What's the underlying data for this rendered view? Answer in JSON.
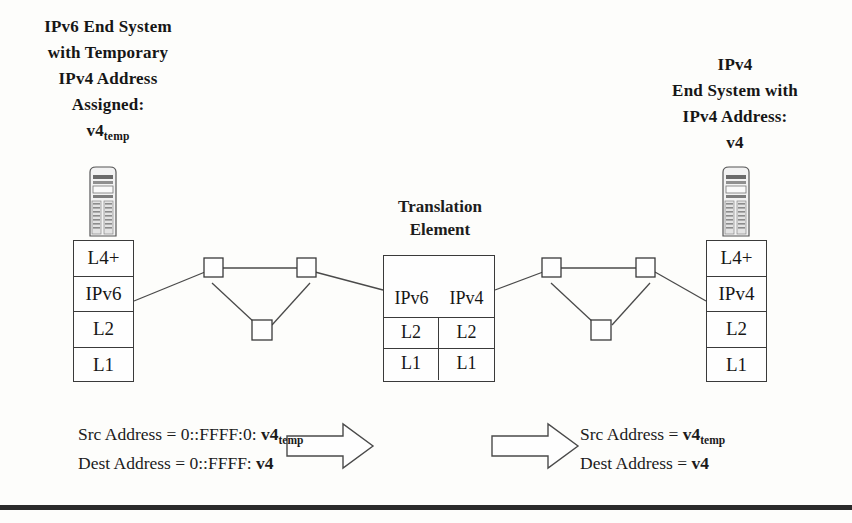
{
  "diagram": {
    "left_end_system": {
      "caption_lines": [
        "IPv6 End System",
        "with Temporary",
        "IPv4 Address",
        "Assigned:"
      ],
      "address_label": "v4",
      "address_subscript": "temp",
      "icon": "server-tower-icon",
      "stack": [
        "L4+",
        "IPv6",
        "L2",
        "L1"
      ]
    },
    "right_end_system": {
      "caption_lines": [
        "IPv4",
        "End System with",
        "IPv4 Address:",
        "v4"
      ],
      "icon": "server-tower-icon",
      "stack": [
        "L4+",
        "IPv4",
        "L2",
        "L1"
      ]
    },
    "translation_element": {
      "caption_lines": [
        "Translation",
        "Element"
      ],
      "top_left": "IPv6",
      "top_right": "IPv4",
      "rows": [
        {
          "left": "L2",
          "right": "L2"
        },
        {
          "left": "L1",
          "right": "L1"
        }
      ]
    },
    "left_network": {
      "name": "IPv6 network cloud",
      "routers": [
        "router-1",
        "router-2",
        "router-3"
      ]
    },
    "right_network": {
      "name": "IPv4 network cloud",
      "routers": [
        "router-4",
        "router-5",
        "router-6"
      ]
    },
    "left_addresses": {
      "src_prefix": "Src Address = 0::FFFF:0: ",
      "src_value": "v4",
      "src_value_sub": "temp",
      "dest_prefix": "Dest Address = 0::FFFF: ",
      "dest_value": "v4"
    },
    "right_addresses": {
      "src_prefix": "Src Address = ",
      "src_value": "v4",
      "src_value_sub": "temp",
      "dest_prefix": "Dest Address = ",
      "dest_value": "v4"
    },
    "arrows": {
      "left_arrow": "right-arrow-icon",
      "right_arrow": "right-arrow-icon"
    },
    "colors": {
      "ink": "#1d1d1d",
      "line": "#4a4a4a",
      "box_stroke": "#3a3a3a",
      "background": "#fdfdfb",
      "rule": "#2b2b2b"
    }
  }
}
